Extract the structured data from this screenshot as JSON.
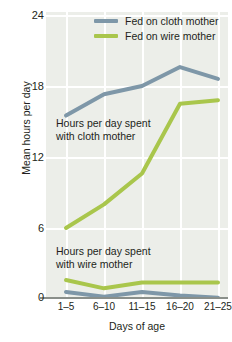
{
  "chart_data": {
    "type": "line",
    "title": "",
    "xlabel": "Days of age",
    "ylabel": "Mean hours per day",
    "categories": [
      "1–5",
      "6–10",
      "11–15",
      "16–20",
      "21–25"
    ],
    "ylim": [
      0,
      24
    ],
    "yticks": [
      0,
      6,
      12,
      18,
      24
    ],
    "grid": true,
    "legend_position": "top-right",
    "series": [
      {
        "name": "Fed on cloth mother",
        "color": "#7e97a8",
        "group": "time-with-cloth-mother",
        "values": [
          15.5,
          17.3,
          18.0,
          19.6,
          18.6
        ]
      },
      {
        "name": "Fed on wire mother",
        "color": "#a9c64c",
        "group": "time-with-cloth-mother",
        "values": [
          6.0,
          8.0,
          10.6,
          16.5,
          16.8
        ]
      },
      {
        "name": "Fed on wire mother",
        "color": "#a9c64c",
        "group": "time-with-wire-mother",
        "values": [
          1.6,
          0.9,
          1.4,
          1.4,
          1.4
        ]
      },
      {
        "name": "Fed on cloth mother",
        "color": "#7e97a8",
        "group": "time-with-wire-mother",
        "values": [
          0.6,
          0.2,
          0.6,
          0.3,
          0.1
        ]
      }
    ],
    "annotations": [
      {
        "id": "cloth",
        "line1": "Hours per day spent",
        "line2": "with cloth mother"
      },
      {
        "id": "wire",
        "line1": "Hours per day spent",
        "line2": "with wire mother"
      }
    ]
  },
  "legend": {
    "items": [
      {
        "label": "Fed on cloth mother",
        "color": "#7e97a8"
      },
      {
        "label": "Fed on wire mother",
        "color": "#a9c64c"
      }
    ]
  },
  "axes": {
    "y": {
      "title": "Mean hours per day",
      "ticks": [
        "0",
        "6",
        "12",
        "18",
        "24"
      ]
    },
    "x": {
      "title": "Days of age",
      "ticks": [
        "1–5",
        "6–10",
        "11–15",
        "16–20",
        "21–25"
      ]
    }
  },
  "colors": {
    "cloth": "#7e97a8",
    "wire": "#a9c64c",
    "panel": "#eceee9",
    "grid": "#ffffff",
    "axis": "#8a8f8a",
    "text": "#231f20"
  }
}
